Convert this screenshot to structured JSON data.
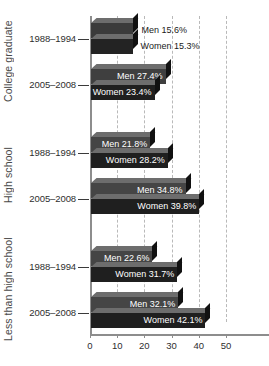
{
  "chart_data": {
    "type": "bar",
    "orientation": "horizontal",
    "title": "",
    "xlabel": "",
    "ylabel": "",
    "xlim": [
      0,
      57
    ],
    "xticks": [
      0,
      10,
      20,
      30,
      40,
      50
    ],
    "xtick_labels": [
      "0",
      "10",
      "20",
      "30",
      "40",
      "50"
    ],
    "grid": "vertical-dashed",
    "legend": "none",
    "value_suffix": "%",
    "series": [
      {
        "name": "Men",
        "values": [
          15.6,
          27.4,
          21.8,
          34.8,
          22.6,
          32.1
        ]
      },
      {
        "name": "Women",
        "values": [
          15.3,
          23.4,
          28.2,
          39.8,
          31.7,
          42.1
        ]
      }
    ],
    "categories": [
      "College graduate 1988-1994",
      "College graduate 2005-2008",
      "High school 1988-1994",
      "High school 2005-2008",
      "Less than high school 1988-1994",
      "Less than high school 2005-2008"
    ],
    "groups": [
      {
        "label": "College graduate",
        "periods": [
          {
            "label": "1988–1994",
            "bars": [
              {
                "label": "Men 15.6%",
                "series": "Men",
                "value": 15.6,
                "color": "#3b3b3b",
                "label_inside": false
              },
              {
                "label": "Women 15.3%",
                "series": "Women",
                "value": 15.3,
                "color": "#232323",
                "label_inside": false
              }
            ]
          },
          {
            "label": "2005–2008",
            "bars": [
              {
                "label": "Men 27.4%",
                "series": "Men",
                "value": 27.4,
                "color": "#3f3f3f",
                "label_inside": true
              },
              {
                "label": "Women 23.4%",
                "series": "Women",
                "value": 23.4,
                "color": "#1f1f1f",
                "label_inside": true
              }
            ]
          }
        ]
      },
      {
        "label": "High school",
        "periods": [
          {
            "label": "1988–1994",
            "bars": [
              {
                "label": "Men 21.8%",
                "series": "Men",
                "value": 21.8,
                "color": "#454545",
                "label_inside": true
              },
              {
                "label": "Women 28.2%",
                "series": "Women",
                "value": 28.2,
                "color": "#1f1f1f",
                "label_inside": true
              }
            ]
          },
          {
            "label": "2005–2008",
            "bars": [
              {
                "label": "Men 34.8%",
                "series": "Men",
                "value": 34.8,
                "color": "#454545",
                "label_inside": true
              },
              {
                "label": "Women 39.8%",
                "series": "Women",
                "value": 39.8,
                "color": "#1f1f1f",
                "label_inside": true
              }
            ]
          }
        ]
      },
      {
        "label": "Less than high school",
        "periods": [
          {
            "label": "1988–1994",
            "bars": [
              {
                "label": "Men 22.6%",
                "series": "Men",
                "value": 22.6,
                "color": "#454545",
                "label_inside": true
              },
              {
                "label": "Women 31.7%",
                "series": "Women",
                "value": 31.7,
                "color": "#1f1f1f",
                "label_inside": true
              }
            ]
          },
          {
            "label": "2005–2008",
            "bars": [
              {
                "label": "Men 32.1%",
                "series": "Men",
                "value": 32.1,
                "color": "#454545",
                "label_inside": true
              },
              {
                "label": "Women 42.1%",
                "series": "Women",
                "value": 42.1,
                "color": "#1f1f1f",
                "label_inside": true
              }
            ]
          }
        ]
      }
    ]
  },
  "colors": {
    "axis": "#8d8d8d",
    "gridline": "#b9b9b9",
    "men_bar": "#454545",
    "women_bar": "#1f1f1f",
    "bar_top": "#6d6d6d",
    "bar_side": "#111111",
    "text": "#2e2e2e",
    "value_text": "#ffffff",
    "value_text_outside": "#1a1a1a",
    "background": "#ffffff"
  }
}
